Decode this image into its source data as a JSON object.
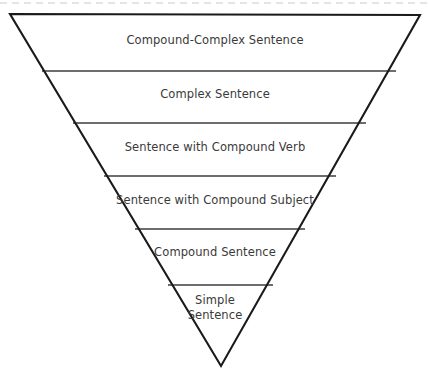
{
  "diagram": {
    "type": "inverted-triangle-pyramid",
    "colors": {
      "background": "#ffffff",
      "outline": "#1a1a1a",
      "divider": "#3c3c3c",
      "dashed_rule": "#c9c9c9",
      "text": "#3a3a3a"
    },
    "top_rule": {
      "style": "dashed",
      "y": 3
    },
    "outline": {
      "top_left_x": 10,
      "top_left_y": 14,
      "top_right_x": 420,
      "top_right_y": 15,
      "apex_x": 221,
      "apex_y": 366
    },
    "bands": [
      {
        "index": 1,
        "label": "Compound-Complex Sentence",
        "label_lines": [
          "Compound-Complex Sentence"
        ],
        "top_y": 14,
        "bottom_y": 71,
        "text_x": 215,
        "text_y": 33
      },
      {
        "index": 2,
        "label": "Complex Sentence",
        "label_lines": [
          "Complex Sentence"
        ],
        "top_y": 71,
        "bottom_y": 123,
        "text_x": 215,
        "text_y": 87
      },
      {
        "index": 3,
        "label": "Sentence with Compound Verb",
        "label_lines": [
          "Sentence with Compound Verb"
        ],
        "top_y": 123,
        "bottom_y": 176,
        "text_x": 215,
        "text_y": 140
      },
      {
        "index": 4,
        "label": "Sentence with Compound Subject",
        "label_lines": [
          "Sentence with Compound Subject"
        ],
        "top_y": 176,
        "bottom_y": 229,
        "text_x": 215,
        "text_y": 193
      },
      {
        "index": 5,
        "label": "Compound Sentence",
        "label_lines": [
          "Compound Sentence"
        ],
        "top_y": 229,
        "bottom_y": 285,
        "text_x": 215,
        "text_y": 245
      },
      {
        "index": 6,
        "label": "Simple Sentence",
        "label_lines": [
          "Simple",
          "Sentence"
        ],
        "top_y": 285,
        "bottom_y": 366,
        "text_x": 215,
        "text_y": 293
      }
    ],
    "dividers": [
      {
        "index": 1,
        "y": 71,
        "x1": 42,
        "x2": 396
      },
      {
        "index": 2,
        "y": 123,
        "x1": 73,
        "x2": 366
      },
      {
        "index": 3,
        "y": 176,
        "x1": 104,
        "x2": 336
      },
      {
        "index": 4,
        "y": 229,
        "x1": 135,
        "x2": 305
      },
      {
        "index": 5,
        "y": 285,
        "x1": 168,
        "x2": 273
      }
    ]
  }
}
